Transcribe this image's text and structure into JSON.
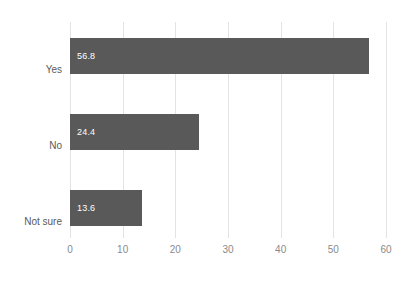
{
  "chart_data": {
    "type": "bar",
    "orientation": "horizontal",
    "title": "",
    "subtitle": "",
    "xlabel": "",
    "ylabel": "",
    "categories": [
      "Yes",
      "No",
      "Not sure"
    ],
    "values": [
      56.8,
      24.4,
      13.6
    ],
    "data_labels": [
      "56.8",
      "24.4",
      "13.6"
    ],
    "xlim": [
      0,
      60
    ],
    "xticks": [
      0,
      10,
      20,
      30,
      40,
      50,
      60
    ],
    "xtick_labels": [
      "0",
      "10",
      "20",
      "30",
      "40",
      "50",
      "60"
    ],
    "grid": true,
    "grid_axis": "x",
    "legend": false,
    "legend_position": "none",
    "series": [
      {
        "name": "",
        "values": [
          56.8,
          24.4,
          13.6
        ]
      }
    ]
  },
  "style": {
    "bar_color": "#595959",
    "data_label_color": "#ffffff",
    "gridline_color": "#e3e3e3",
    "axis_line_color": "#e0e0e0",
    "category_label_color": "#5a5a5a",
    "tick_label_color": "#8a8a8a",
    "background_color": "#ffffff"
  }
}
